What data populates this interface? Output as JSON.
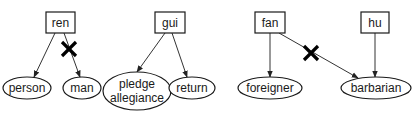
{
  "diagram": {
    "type": "lexical-relation-trees",
    "groups": [
      {
        "head": {
          "id": "ren",
          "label": "ren"
        },
        "children": [
          {
            "id": "person",
            "label": "person",
            "blocked": false
          },
          {
            "id": "man",
            "label": "man",
            "blocked": true
          }
        ]
      },
      {
        "head": {
          "id": "gui",
          "label": "gui"
        },
        "children": [
          {
            "id": "pledge_allegiance",
            "label_line1": "pledge",
            "label_line2": "allegiance",
            "blocked": false
          },
          {
            "id": "return",
            "label": "return",
            "blocked": false
          }
        ]
      },
      {
        "head": {
          "id": "fan",
          "label": "fan"
        },
        "children": [
          {
            "id": "foreigner",
            "label": "foreigner",
            "blocked": false
          },
          {
            "id": "barbarian",
            "label": "barbarian",
            "blocked": true
          }
        ]
      },
      {
        "head": {
          "id": "hu",
          "label": "hu"
        },
        "children": [
          {
            "id": "barbarian",
            "label": "barbarian",
            "blocked": false
          }
        ]
      }
    ],
    "legend_marks": {
      "blocked_edge": "X"
    }
  },
  "colors": {
    "stroke": "#1a1a1a",
    "cross": "#000000",
    "background": "#ffffff"
  }
}
